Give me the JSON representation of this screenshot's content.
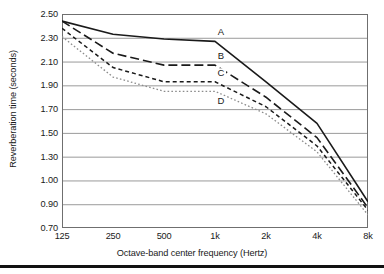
{
  "figure": {
    "background": "#ffffff",
    "bottom_rule_color": "#111111"
  },
  "axes": {
    "y_title": "Reverberation time (seconds)",
    "x_title": "Octave-band center frequency (Hertz)",
    "y_tick_labels": [
      "2.50",
      "2.30",
      "2.10",
      "1.90",
      "1.70",
      "1.50",
      "1.30",
      "1.00",
      "0.90",
      "0.70"
    ],
    "x_tick_labels": [
      "125",
      "250",
      "500",
      "1k",
      "2k",
      "4k",
      "8k"
    ],
    "grid_color": "#9a9a9a",
    "frame_color": "#6f6f6f"
  },
  "series_labels": [
    {
      "text": "A"
    },
    {
      "text": "B"
    },
    {
      "text": "C"
    },
    {
      "text": "D"
    }
  ],
  "chart_data": {
    "type": "line",
    "title": "",
    "xlabel": "Octave-band center frequency (Hertz)",
    "ylabel": "Reverberation time (seconds)",
    "x": [
      "125",
      "250",
      "500",
      "1k",
      "2k",
      "4k",
      "8k"
    ],
    "x_scale": "octave-band (categorical)",
    "y_tick_values": [
      2.5,
      2.3,
      2.1,
      1.9,
      1.7,
      1.5,
      1.3,
      1.0,
      0.9,
      0.7
    ],
    "y_tick_labels": [
      "2.50",
      "2.30",
      "2.10",
      "1.90",
      "1.70",
      "1.50",
      "1.30",
      "1.00",
      "0.90",
      "0.70"
    ],
    "ylim": [
      0.7,
      2.5
    ],
    "grid": "horizontal",
    "legend": "inline-labels-at-1k",
    "series": [
      {
        "name": "A",
        "style": "solid",
        "color": "#1a1a1a",
        "values": [
          2.44,
          2.33,
          2.29,
          2.27,
          1.93,
          1.58,
          0.91
        ]
      },
      {
        "name": "B",
        "style": "long-dash",
        "color": "#1a1a1a",
        "values": [
          2.44,
          2.17,
          2.07,
          2.07,
          1.8,
          1.46,
          0.87
        ]
      },
      {
        "name": "C",
        "style": "short-dash",
        "color": "#1a1a1a",
        "values": [
          2.38,
          2.05,
          1.93,
          1.93,
          1.72,
          1.39,
          0.85
        ]
      },
      {
        "name": "D",
        "style": "dotted",
        "color": "#8c8c8c",
        "values": [
          2.31,
          1.97,
          1.85,
          1.85,
          1.66,
          1.34,
          0.81
        ]
      }
    ]
  }
}
